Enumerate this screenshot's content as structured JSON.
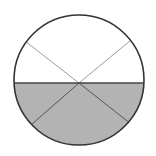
{
  "diagram": {
    "type": "fraction-circle",
    "total_parts": 6,
    "shaded_parts": 3,
    "shaded_fraction": "3/6",
    "circle": {
      "cx": 79,
      "cy": 80,
      "r": 65
    },
    "divider_y": 83,
    "colors": {
      "background": "#ffffff",
      "shade": "#b3b3b3",
      "outline": "#333333",
      "upper_lines": "#9a9a9a",
      "lower_lines": "#555555",
      "divider": "#444444"
    }
  }
}
